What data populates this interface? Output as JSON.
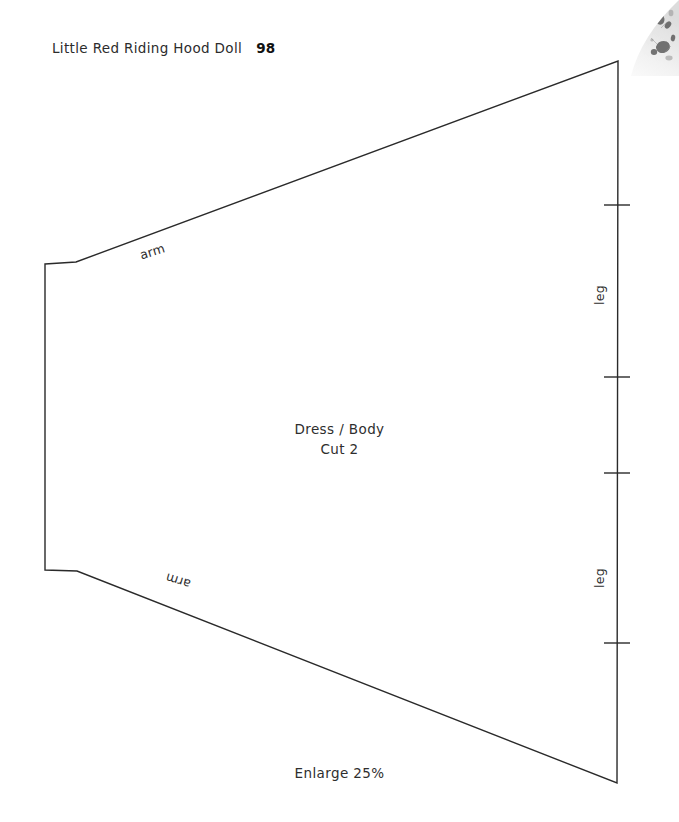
{
  "page": {
    "background_color": "#ffffff",
    "ink_color": "#2a2a2a",
    "width": 679,
    "height": 822
  },
  "header": {
    "title": "Little Red Riding Hood Doll",
    "page_number": "98"
  },
  "pattern": {
    "piece_name": "Dress / Body",
    "cut_instruction": "Cut 2",
    "scale_note": "Enlarge 25%",
    "outline_points": "45,264 76,262 618,61 617,783 77,571 45,570",
    "labels": {
      "arm_top": "arm",
      "arm_bottom": "arm",
      "leg_top": "leg",
      "leg_bottom": "leg"
    },
    "notches": [
      {
        "name": "notch-1",
        "y": 205
      },
      {
        "name": "notch-2",
        "y": 377
      },
      {
        "name": "notch-3",
        "y": 473
      },
      {
        "name": "notch-4",
        "y": 643
      }
    ],
    "notch_x_center": 617,
    "notch_half_width": 13
  },
  "artifact": {
    "name": "scan-bleed-photo-fragment",
    "description": "faint grayscale photo edge at top-right corner"
  }
}
